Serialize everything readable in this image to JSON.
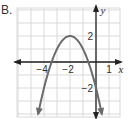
{
  "option_label": "B.",
  "colors": {
    "grid": "#d9d9d9",
    "axis": "#222222",
    "curve": "#6b6b6b",
    "text": "#333333"
  },
  "chart_data": {
    "type": "line",
    "title": "",
    "function": "y = -(x + 2)^2 + 2",
    "xlabel": "x",
    "ylabel": "y",
    "xlim": [
      -6,
      1.8
    ],
    "ylim": [
      -4.2,
      4.2
    ],
    "grid": true,
    "x_tick_labels": [
      "−4",
      "−2",
      "1"
    ],
    "y_tick_labels": [
      "2",
      "−2"
    ],
    "x_ticks": [
      -4,
      -2,
      1
    ],
    "y_ticks": [
      2,
      -2
    ],
    "vertex": [
      -2,
      2
    ],
    "x_intercepts": [
      -3.41,
      -0.59
    ],
    "y_intercept": -2,
    "series": [
      {
        "name": "parabola",
        "x": [
          -4.0,
          -3.5,
          -3.0,
          -2.5,
          -2.0,
          -1.5,
          -1.0,
          -0.5,
          0.0,
          0.35
        ],
        "y": [
          -2.0,
          -0.25,
          1.0,
          1.75,
          2.0,
          1.75,
          1.0,
          -0.25,
          -2.0,
          -3.5
        ]
      }
    ],
    "legend": []
  }
}
